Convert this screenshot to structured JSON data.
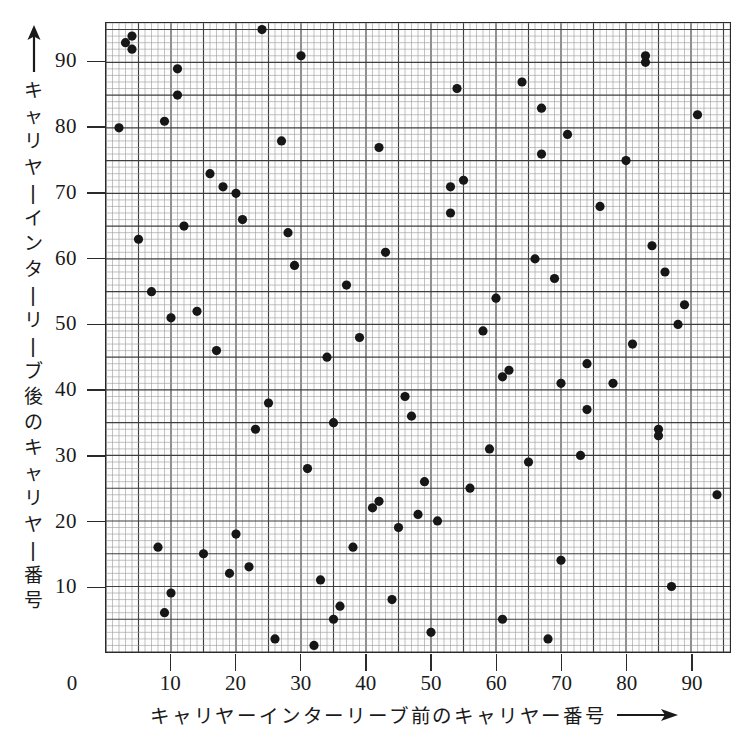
{
  "axes": {
    "x_title": "キャリヤーインターリーブ前のキャリヤー番号",
    "y_title": "キャリヤーインターリーブ後のキャリヤー番号",
    "x_origin_label": "0",
    "x_tick_labels": [
      "10",
      "20",
      "30",
      "40",
      "50",
      "60",
      "70",
      "80",
      "90"
    ],
    "y_tick_labels": [
      "90",
      "80",
      "70",
      "60",
      "50",
      "40",
      "30",
      "20",
      "10"
    ],
    "x_arrow_icon": "right-arrow-icon",
    "y_arrow_icon": "up-arrow-icon"
  },
  "style": {
    "marker_color": "#161616",
    "grid_minor_color": "#9a9a9a",
    "grid_major_color": "#3f3f3f",
    "frame_color": "#2a2a2a",
    "background": "#ffffff"
  },
  "chart_data": {
    "type": "scatter",
    "title": "",
    "xlabel": "キャリヤーインターリーブ前のキャリヤー番号",
    "ylabel": "キャリヤーインターリーブ後のキャリヤー番号",
    "xlim": [
      0,
      96
    ],
    "ylim": [
      0,
      96
    ],
    "xticks": [
      10,
      20,
      30,
      40,
      50,
      60,
      70,
      80,
      90
    ],
    "yticks": [
      10,
      20,
      30,
      40,
      50,
      60,
      70,
      80,
      90
    ],
    "grid": true,
    "grid_minor_step": 1,
    "grid_major_step": 5,
    "legend": null,
    "marker": "filled-circle",
    "points": [
      [
        2,
        80
      ],
      [
        3,
        93
      ],
      [
        4,
        94
      ],
      [
        4,
        92
      ],
      [
        5,
        63
      ],
      [
        7,
        55
      ],
      [
        8,
        16
      ],
      [
        9,
        81
      ],
      [
        9,
        6
      ],
      [
        10,
        51
      ],
      [
        10,
        9
      ],
      [
        11,
        85
      ],
      [
        11,
        89
      ],
      [
        12,
        65
      ],
      [
        14,
        52
      ],
      [
        15,
        15
      ],
      [
        16,
        73
      ],
      [
        17,
        46
      ],
      [
        18,
        71
      ],
      [
        19,
        12
      ],
      [
        20,
        70
      ],
      [
        20,
        18
      ],
      [
        21,
        66
      ],
      [
        22,
        13
      ],
      [
        23,
        34
      ],
      [
        24,
        95
      ],
      [
        25,
        38
      ],
      [
        26,
        2
      ],
      [
        27,
        78
      ],
      [
        28,
        64
      ],
      [
        29,
        59
      ],
      [
        30,
        91
      ],
      [
        31,
        28
      ],
      [
        32,
        1
      ],
      [
        33,
        11
      ],
      [
        34,
        45
      ],
      [
        35,
        5
      ],
      [
        35,
        35
      ],
      [
        36,
        7
      ],
      [
        37,
        56
      ],
      [
        38,
        16
      ],
      [
        39,
        48
      ],
      [
        41,
        22
      ],
      [
        42,
        23
      ],
      [
        42,
        77
      ],
      [
        43,
        61
      ],
      [
        44,
        8
      ],
      [
        45,
        19
      ],
      [
        46,
        39
      ],
      [
        47,
        36
      ],
      [
        48,
        21
      ],
      [
        49,
        26
      ],
      [
        50,
        3
      ],
      [
        51,
        20
      ],
      [
        53,
        67
      ],
      [
        53,
        71
      ],
      [
        54,
        86
      ],
      [
        55,
        72
      ],
      [
        56,
        25
      ],
      [
        58,
        49
      ],
      [
        59,
        31
      ],
      [
        60,
        54
      ],
      [
        61,
        42
      ],
      [
        61,
        5
      ],
      [
        62,
        43
      ],
      [
        64,
        87
      ],
      [
        65,
        29
      ],
      [
        66,
        60
      ],
      [
        67,
        83
      ],
      [
        67,
        76
      ],
      [
        68,
        2
      ],
      [
        69,
        57
      ],
      [
        70,
        14
      ],
      [
        70,
        41
      ],
      [
        71,
        79
      ],
      [
        73,
        30
      ],
      [
        74,
        37
      ],
      [
        74,
        44
      ],
      [
        76,
        68
      ],
      [
        78,
        41
      ],
      [
        80,
        75
      ],
      [
        81,
        47
      ],
      [
        83,
        90
      ],
      [
        83,
        91
      ],
      [
        84,
        62
      ],
      [
        85,
        34
      ],
      [
        85,
        33
      ],
      [
        86,
        58
      ],
      [
        87,
        10
      ],
      [
        88,
        50
      ],
      [
        89,
        53
      ],
      [
        91,
        82
      ],
      [
        94,
        24
      ]
    ]
  }
}
